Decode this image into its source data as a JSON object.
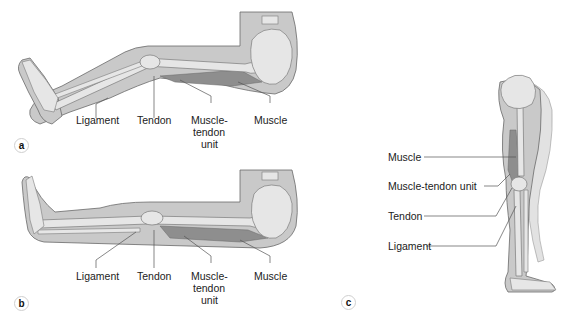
{
  "figure": {
    "panels": [
      {
        "id": "a",
        "badge": "a",
        "view": "leg lying with knee bent (flexed)",
        "labels": {
          "ligament": "Ligament",
          "tendon": "Tendon",
          "muscle_tendon_unit_1": "Muscle-",
          "muscle_tendon_unit_2": "tendon",
          "muscle_tendon_unit_3": "unit",
          "muscle": "Muscle"
        }
      },
      {
        "id": "b",
        "badge": "b",
        "view": "leg lying straight (extended)",
        "labels": {
          "ligament": "Ligament",
          "tendon": "Tendon",
          "muscle_tendon_unit_1": "Muscle-",
          "muscle_tendon_unit_2": "tendon",
          "muscle_tendon_unit_3": "unit",
          "muscle": "Muscle"
        }
      },
      {
        "id": "c",
        "badge": "c",
        "view": "standing leg, lateral view",
        "labels": {
          "muscle": "Muscle",
          "muscle_tendon_unit": "Muscle-tendon unit",
          "tendon": "Tendon",
          "ligament": "Ligament"
        }
      }
    ],
    "colors": {
      "skin": "#c9c9c9",
      "skin_outline": "#6a6a6a",
      "bone": "#e6e6e6",
      "bone_outline": "#7a7a7a",
      "muscle": "#8e8e8e",
      "leader_line": "#555555",
      "text": "#222222"
    }
  }
}
